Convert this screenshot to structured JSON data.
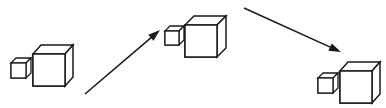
{
  "canvas": {
    "width": 386,
    "height": 108,
    "background_color": "#ffffff",
    "stroke_color": "#1a1a1a",
    "fill_color": "#ffffff"
  },
  "diagram": {
    "projection": "oblique-cabinet-up-right",
    "groups": [
      {
        "id": "group-left",
        "label": "left-cube-pair",
        "small_cube": {
          "id": "small-cube-left",
          "front_x": 11,
          "front_y": 63,
          "size": 15,
          "depth_x": 5,
          "depth_y": -5,
          "stroke_width": 1.3
        },
        "large_cube": {
          "id": "large-cube-left",
          "front_x": 33,
          "front_y": 54,
          "size": 32,
          "depth_x": 8,
          "depth_y": -9,
          "stroke_width": 1.5
        }
      },
      {
        "id": "group-middle",
        "label": "middle-cube-pair",
        "small_cube": {
          "id": "small-cube-middle",
          "front_x": 165,
          "front_y": 31,
          "size": 14,
          "depth_x": 5,
          "depth_y": -5,
          "stroke_width": 1.3
        },
        "large_cube": {
          "id": "large-cube-middle",
          "front_x": 185,
          "front_y": 25,
          "size": 32,
          "depth_x": 9,
          "depth_y": -9,
          "stroke_width": 1.5
        }
      },
      {
        "id": "group-right",
        "label": "right-cube-pair",
        "small_cube": {
          "id": "small-cube-right",
          "front_x": 318,
          "front_y": 78,
          "size": 15,
          "depth_x": 5,
          "depth_y": -5,
          "stroke_width": 1.3
        },
        "large_cube": {
          "id": "large-cube-right",
          "front_x": 340,
          "front_y": 71,
          "size": 32,
          "depth_x": 8,
          "depth_y": -9,
          "stroke_width": 1.5
        }
      }
    ],
    "arrows": [
      {
        "id": "arrow-left-to-middle",
        "label": "ascending-arrow",
        "direction": "up-right",
        "x1": 85,
        "y1": 94,
        "x2": 160,
        "y2": 30,
        "stroke_width": 1.6,
        "head_length": 12,
        "head_width": 8
      },
      {
        "id": "arrow-middle-to-right",
        "label": "descending-arrow",
        "direction": "down-right",
        "x1": 244,
        "y1": 8,
        "x2": 341,
        "y2": 52,
        "stroke_width": 1.6,
        "head_length": 12,
        "head_width": 8
      }
    ]
  }
}
